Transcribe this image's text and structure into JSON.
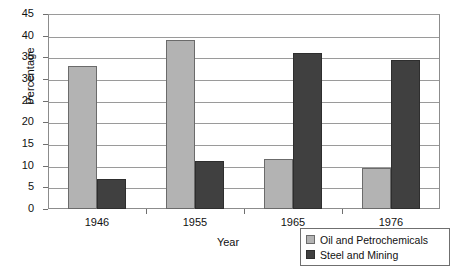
{
  "chart_data": {
    "type": "bar",
    "title": "",
    "xlabel": "Year",
    "ylabel": "Percentage",
    "categories": [
      "1946",
      "1955",
      "1965",
      "1976"
    ],
    "series": [
      {
        "name": "Oil and Petrochemicals",
        "color": "#b3b3b3",
        "values": [
          33,
          39,
          11.5,
          9.5
        ]
      },
      {
        "name": "Steel and Mining",
        "color": "#404040",
        "values": [
          7,
          11,
          36,
          34.5
        ]
      }
    ],
    "ylim": [
      0,
      45
    ],
    "ytick_step": 5,
    "yticks": [
      "45",
      "40",
      "35",
      "30",
      "25",
      "20",
      "15",
      "10",
      "5",
      "0"
    ],
    "grid": true,
    "legend_position": "bottom-right"
  }
}
